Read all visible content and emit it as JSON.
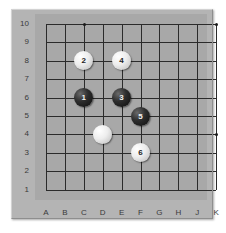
{
  "diagram": {
    "kind": "go-board-diagram",
    "board_size_cols": 10,
    "board_size_rows": 10,
    "frame_color": "#b4b4b4",
    "surface_color": "#a8a8a8",
    "line_color": "#2b2b2b",
    "label_color": "#3a3a3a",
    "black_stone_color": "#111111",
    "white_stone_color": "#f2f2f2"
  },
  "columns": [
    "A",
    "B",
    "C",
    "D",
    "E",
    "F",
    "G",
    "H",
    "J",
    "K"
  ],
  "rows": [
    "10",
    "9",
    "8",
    "7",
    "6",
    "5",
    "4",
    "3",
    "2",
    "1"
  ],
  "star_points": [
    {
      "col": "C",
      "row": "10"
    },
    {
      "col": "K",
      "row": "10"
    },
    {
      "col": "K",
      "row": "4"
    }
  ],
  "stones": [
    {
      "label": "2",
      "color": "white",
      "col": "C",
      "row": "8"
    },
    {
      "label": "4",
      "color": "white",
      "col": "E",
      "row": "8"
    },
    {
      "label": "1",
      "color": "black",
      "col": "C",
      "row": "6"
    },
    {
      "label": "3",
      "color": "black",
      "col": "E",
      "row": "6"
    },
    {
      "label": "5",
      "color": "black",
      "col": "F",
      "row": "5"
    },
    {
      "label": "",
      "color": "white",
      "col": "D",
      "row": "4"
    },
    {
      "label": "6",
      "color": "white",
      "col": "F",
      "row": "3"
    }
  ]
}
